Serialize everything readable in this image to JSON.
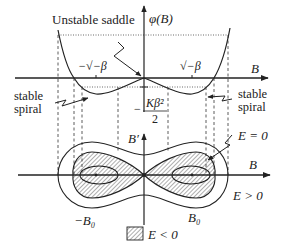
{
  "figure": {
    "type": "phase-portrait-diagram",
    "upper_plot": {
      "y_axis_label": "φ(B)",
      "x_axis_label": "B",
      "annotations": {
        "saddle": "Unstable saddle",
        "spiral_left_line1": "stable",
        "spiral_left_line2": "spiral",
        "spiral_right_line1": "stable",
        "spiral_right_line2": "spiral",
        "min_left": "−√−β",
        "min_right": "√−β",
        "min_value_num": "Kβ²",
        "min_value_den": "2",
        "min_value_sign": "−"
      }
    },
    "lower_plot": {
      "y_axis_label": "B′",
      "x_axis_label": "B",
      "labels": {
        "neg_B0": "−B₀",
        "pos_B0": "B₀",
        "separatrix": "E = 0",
        "outer": "E > 0"
      },
      "legend": {
        "hatched": "E < 0"
      }
    },
    "colors": {
      "line": "#222222",
      "background": "#ffffff"
    }
  }
}
